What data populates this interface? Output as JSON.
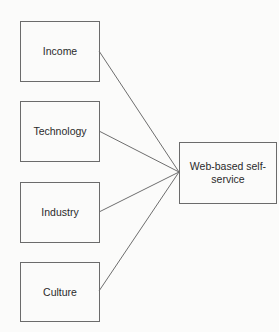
{
  "diagram": {
    "type": "many-to-one relationship diagram",
    "sources": [
      {
        "id": "income",
        "label": "Income"
      },
      {
        "id": "technology",
        "label": "Technology"
      },
      {
        "id": "industry",
        "label": "Industry"
      },
      {
        "id": "culture",
        "label": "Culture"
      }
    ],
    "target": {
      "id": "web-self-service",
      "label": "Web-based self-service"
    },
    "edges": [
      {
        "from": "income",
        "to": "web-self-service"
      },
      {
        "from": "technology",
        "to": "web-self-service"
      },
      {
        "from": "industry",
        "to": "web-self-service"
      },
      {
        "from": "culture",
        "to": "web-self-service"
      }
    ]
  }
}
